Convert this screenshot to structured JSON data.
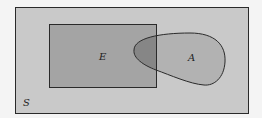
{
  "diagram": {
    "type": "venn",
    "sets": [
      {
        "id": "S",
        "label": "S",
        "shape": "rectangle",
        "role": "sample-space"
      },
      {
        "id": "E",
        "label": "E",
        "shape": "rectangle"
      },
      {
        "id": "A",
        "label": "A",
        "shape": "blob"
      }
    ],
    "regions": [
      {
        "name": "E-and-A-overlap",
        "shaded": "darkest"
      }
    ]
  },
  "labels": {
    "sample_space": "S",
    "event_e": "E",
    "event_a": "A"
  },
  "colors": {
    "page": "#f4f4f4",
    "sample_space_fill": "#c9c9c9",
    "e_fill": "#a4a4a4",
    "a_fill": "#b2b2b2",
    "overlap_fill": "#868686",
    "stroke": "#2a2a2a"
  }
}
